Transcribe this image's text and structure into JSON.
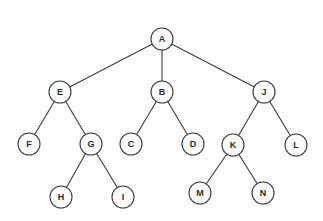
{
  "diagram": {
    "type": "tree",
    "title": "",
    "background_color": "#fdfdfd",
    "stroke_color": "#3c3c3c",
    "text_color": "#2e2e2e",
    "node_radius": 11,
    "nodes": [
      {
        "id": "A",
        "label": "A",
        "x": 162,
        "y": 39,
        "level": 1
      },
      {
        "id": "E",
        "label": "E",
        "x": 60,
        "y": 92,
        "level": 2
      },
      {
        "id": "B",
        "label": "B",
        "x": 162,
        "y": 92,
        "level": 2
      },
      {
        "id": "J",
        "label": "J",
        "x": 264,
        "y": 92,
        "level": 2
      },
      {
        "id": "F",
        "label": "F",
        "x": 29,
        "y": 144,
        "level": 3
      },
      {
        "id": "G",
        "label": "G",
        "x": 91,
        "y": 144,
        "level": 3
      },
      {
        "id": "C",
        "label": "C",
        "x": 131,
        "y": 144,
        "level": 3
      },
      {
        "id": "D",
        "label": "D",
        "x": 193,
        "y": 144,
        "level": 3
      },
      {
        "id": "K",
        "label": "K",
        "x": 233,
        "y": 145,
        "level": 3
      },
      {
        "id": "L",
        "label": "L",
        "x": 296,
        "y": 145,
        "level": 3
      },
      {
        "id": "H",
        "label": "H",
        "x": 61,
        "y": 197,
        "level": 4
      },
      {
        "id": "I",
        "label": "I",
        "x": 123,
        "y": 197,
        "level": 4
      },
      {
        "id": "M",
        "label": "M",
        "x": 200,
        "y": 193,
        "level": 4
      },
      {
        "id": "N",
        "label": "N",
        "x": 263,
        "y": 193,
        "level": 4
      }
    ],
    "edges": [
      {
        "from": "A",
        "to": "E"
      },
      {
        "from": "A",
        "to": "B"
      },
      {
        "from": "A",
        "to": "J"
      },
      {
        "from": "E",
        "to": "F"
      },
      {
        "from": "E",
        "to": "G"
      },
      {
        "from": "B",
        "to": "C"
      },
      {
        "from": "B",
        "to": "D"
      },
      {
        "from": "J",
        "to": "K"
      },
      {
        "from": "J",
        "to": "L"
      },
      {
        "from": "G",
        "to": "H"
      },
      {
        "from": "G",
        "to": "I"
      },
      {
        "from": "K",
        "to": "M"
      },
      {
        "from": "K",
        "to": "N"
      }
    ]
  }
}
